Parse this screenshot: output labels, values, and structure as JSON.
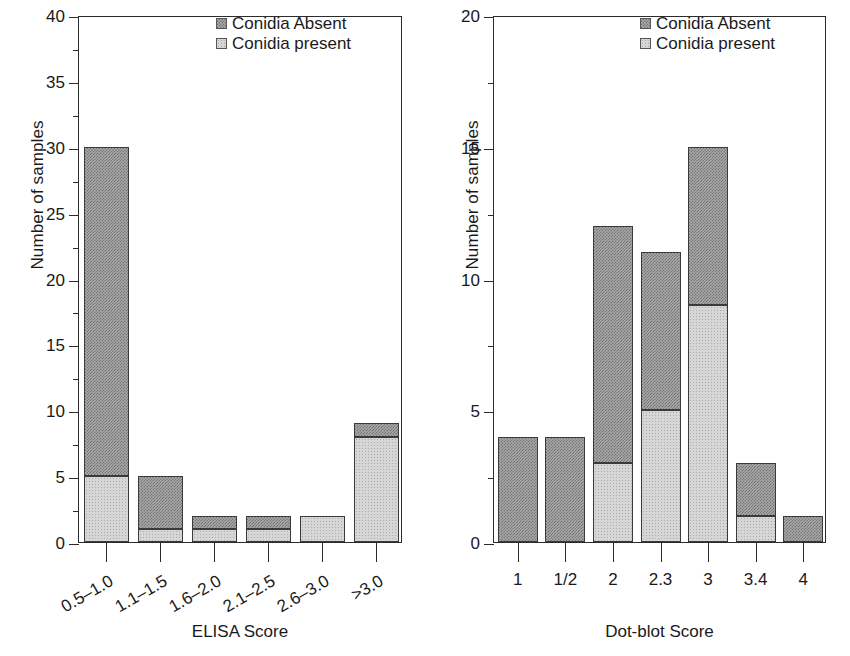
{
  "chart_data": [
    {
      "panel": "left",
      "type": "bar",
      "stacked": true,
      "title": "",
      "xlabel": "ELISA Score",
      "ylabel": "Number of samples",
      "ylim": [
        0,
        40
      ],
      "ytick_major": [
        0,
        5,
        10,
        15,
        20,
        25,
        30,
        35,
        40
      ],
      "ytick_minor": [
        2.5,
        7.5,
        12.5,
        17.5,
        22.5,
        27.5,
        32.5,
        37.5
      ],
      "grid": false,
      "legend_position": "top-right",
      "categories": [
        "0.5–1.0",
        "1.1–1.5",
        "1.6–2.0",
        "2.1–2.5",
        "2.6–3.0",
        ">3.0"
      ],
      "series": [
        {
          "name": "Conidia present",
          "values": [
            5,
            1,
            1,
            1,
            2,
            8
          ]
        },
        {
          "name": "Conidia Absent",
          "values": [
            25,
            4,
            1,
            1,
            0,
            1
          ]
        }
      ],
      "totals": [
        30,
        5,
        2,
        2,
        2,
        9
      ]
    },
    {
      "panel": "right",
      "type": "bar",
      "stacked": true,
      "title": "",
      "xlabel": "Dot-blot Score",
      "ylabel": "Number of samples",
      "ylim": [
        0,
        20
      ],
      "ytick_major": [
        0,
        5,
        10,
        15,
        20
      ],
      "ytick_minor": [
        2.5,
        7.5,
        12.5,
        17.5
      ],
      "grid": false,
      "legend_position": "top-right",
      "categories": [
        "1",
        "1/2",
        "2",
        "2.3",
        "3",
        "3.4",
        "4"
      ],
      "series": [
        {
          "name": "Conidia present",
          "values": [
            0,
            0,
            3,
            5,
            9,
            1,
            0
          ]
        },
        {
          "name": "Conidia Absent",
          "values": [
            4,
            4,
            9,
            6,
            6,
            2,
            1
          ]
        }
      ],
      "totals": [
        4,
        4,
        12,
        11,
        15,
        3,
        1
      ]
    }
  ],
  "left_panel": {
    "ylabel": "Number of samples",
    "xlabel": "ELISA Score",
    "ytick_labels": [
      "40",
      "35",
      "30",
      "25",
      "20",
      "15",
      "10",
      "5",
      "0"
    ],
    "xtick_labels": [
      "0.5–1.0",
      "1.1–1.5",
      "1.6–2.0",
      "2.1–2.5",
      "2.6–3.0",
      ">3.0"
    ],
    "legend": [
      {
        "label": "Conidia Absent",
        "swatch": "legend-swatch-absent"
      },
      {
        "label": "Conidia present",
        "swatch": "legend-swatch-present"
      }
    ]
  },
  "right_panel": {
    "ylabel": "Number of samples",
    "xlabel": "Dot-blot Score",
    "ytick_labels": [
      "20",
      "15",
      "10",
      "5",
      "0"
    ],
    "xtick_labels": [
      "1",
      "1/2",
      "2",
      "2.3",
      "3",
      "3.4",
      "4"
    ],
    "legend": [
      {
        "label": "Conidia Absent",
        "swatch": "legend-swatch-absent"
      },
      {
        "label": "Conidia present",
        "swatch": "legend-swatch-present"
      }
    ]
  },
  "colors": {
    "absent_fill": "#a8a8a8",
    "present_fill": "#d6d6d6",
    "axis": "#2b2b2b",
    "text": "#1a1a1a",
    "background": "#ffffff"
  }
}
